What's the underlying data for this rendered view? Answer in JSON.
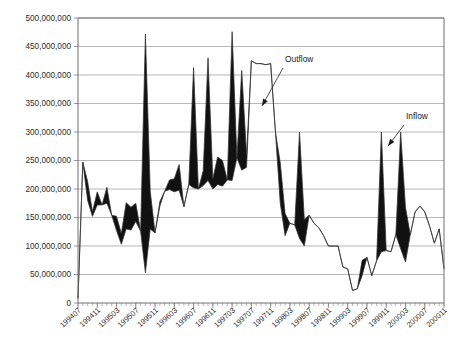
{
  "chart_data": {
    "type": "area",
    "title": "",
    "subtitle": "",
    "xlabel": "",
    "ylabel": "",
    "ylim": [
      0,
      500000000
    ],
    "ytick_values": [
      0,
      50000000,
      100000000,
      150000000,
      200000000,
      250000000,
      300000000,
      350000000,
      400000000,
      450000000,
      500000000
    ],
    "ytick_labels": [
      "0",
      "50,000,000",
      "100,000,000",
      "150,000,000",
      "200,000,000",
      "250,000,000",
      "300,000,000",
      "350,000,000",
      "400,000,000",
      "450,000,000",
      "500,000,000"
    ],
    "grid": true,
    "legend_position": "annotations",
    "annotations": [
      {
        "label": "Outflow",
        "text_x": 285,
        "text_y": 62,
        "arrow_x1": 283,
        "arrow_y1": 68,
        "arrow_x2": 262,
        "arrow_y2": 106
      },
      {
        "label": "Inflow",
        "text_x": 406,
        "text_y": 119,
        "arrow_x1": 404,
        "arrow_y1": 125,
        "arrow_x2": 388,
        "arrow_y2": 146
      }
    ],
    "x_axis_format": "YYYYMM",
    "xtick_labels": [
      "199407",
      "199411",
      "199503",
      "199507",
      "199511",
      "199603",
      "199607",
      "199611",
      "199703",
      "199707",
      "199711",
      "199803",
      "199807",
      "199811",
      "199903",
      "199907",
      "199911",
      "200003",
      "200007",
      "200011"
    ],
    "x": [
      "199407",
      "199408",
      "199409",
      "199410",
      "199411",
      "199412",
      "199501",
      "199502",
      "199503",
      "199504",
      "199505",
      "199506",
      "199507",
      "199508",
      "199509",
      "199510",
      "199511",
      "199512",
      "199601",
      "199602",
      "199603",
      "199604",
      "199605",
      "199606",
      "199607",
      "199608",
      "199609",
      "199610",
      "199611",
      "199612",
      "199701",
      "199702",
      "199703",
      "199704",
      "199705",
      "199706",
      "199707",
      "199708",
      "199709",
      "199710",
      "199711",
      "199712",
      "199801",
      "199802",
      "199803",
      "199804",
      "199805",
      "199806",
      "199807",
      "199808",
      "199809",
      "199810",
      "199811",
      "199812",
      "199901",
      "199902",
      "199903",
      "199904",
      "199905",
      "199906",
      "199907",
      "199908",
      "199909",
      "199910",
      "199911",
      "199912",
      "200001",
      "200002",
      "200003",
      "200004",
      "200005",
      "200006",
      "200007",
      "200008",
      "200009",
      "200010",
      "200011"
    ],
    "series": [
      {
        "name": "Inflow",
        "values": [
          8000000,
          247000000,
          213000000,
          160000000,
          195000000,
          172000000,
          203000000,
          154000000,
          152000000,
          122000000,
          176000000,
          168000000,
          175000000,
          126000000,
          472000000,
          196000000,
          123000000,
          178000000,
          196000000,
          216000000,
          218000000,
          243000000,
          169000000,
          208000000,
          413000000,
          200000000,
          232000000,
          430000000,
          218000000,
          256000000,
          250000000,
          216000000,
          476000000,
          255000000,
          408000000,
          260000000,
          425000000,
          420000000,
          420000000,
          418000000,
          420000000,
          300000000,
          246000000,
          157000000,
          140000000,
          137000000,
          300000000,
          146000000,
          154000000,
          140000000,
          132000000,
          118000000,
          100000000,
          100000000,
          100000000,
          63000000,
          60000000,
          22000000,
          25000000,
          75000000,
          80000000,
          48000000,
          74000000,
          300000000,
          92000000,
          90000000,
          120000000,
          300000000,
          168000000,
          120000000,
          160000000,
          170000000,
          160000000,
          135000000,
          105000000,
          130000000,
          60000000
        ],
        "color": "#333333"
      },
      {
        "name": "Outflow",
        "values": [
          8000000,
          247000000,
          180000000,
          152000000,
          172000000,
          172000000,
          175000000,
          154000000,
          127000000,
          103000000,
          130000000,
          128000000,
          143000000,
          126000000,
          53000000,
          130000000,
          123000000,
          170000000,
          196000000,
          199000000,
          195000000,
          198000000,
          169000000,
          208000000,
          202000000,
          200000000,
          206000000,
          215000000,
          200000000,
          208000000,
          205000000,
          216000000,
          215000000,
          255000000,
          233000000,
          238000000,
          425000000,
          420000000,
          420000000,
          418000000,
          420000000,
          300000000,
          175000000,
          118000000,
          140000000,
          137000000,
          113000000,
          100000000,
          154000000,
          140000000,
          132000000,
          118000000,
          100000000,
          100000000,
          100000000,
          63000000,
          60000000,
          22000000,
          25000000,
          48000000,
          80000000,
          48000000,
          74000000,
          90000000,
          92000000,
          90000000,
          120000000,
          95000000,
          72000000,
          120000000,
          160000000,
          170000000,
          160000000,
          135000000,
          105000000,
          130000000,
          60000000
        ],
        "color": "#333333"
      }
    ]
  }
}
